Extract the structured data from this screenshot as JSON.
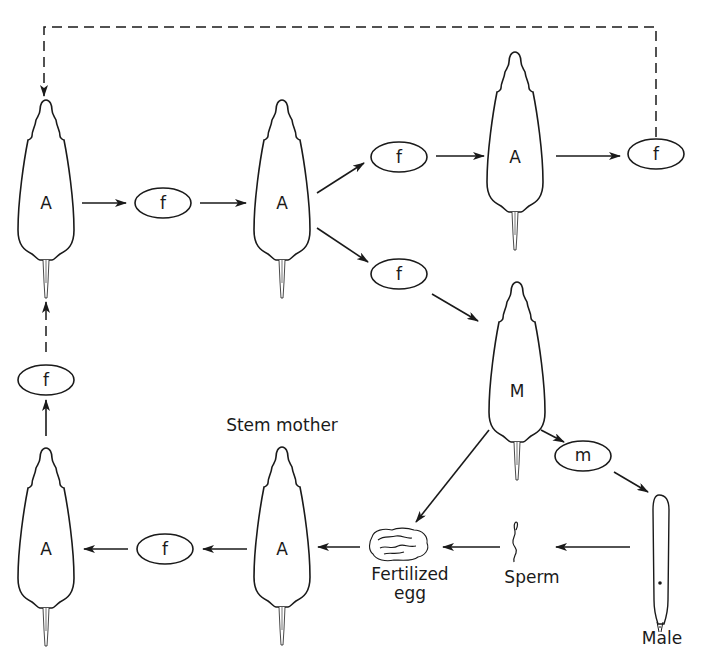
{
  "diagram": {
    "stroke_color": "#1a1a1a",
    "background": "#ffffff",
    "nodes": {
      "aphid_top_left": {
        "label": "A",
        "type": "asexual-female"
      },
      "oval_f_1": {
        "label": "f"
      },
      "aphid_top_middle": {
        "label": "A",
        "type": "asexual-female"
      },
      "oval_f_upper": {
        "label": "f"
      },
      "aphid_top_right": {
        "label": "A",
        "type": "asexual-female"
      },
      "oval_f_right": {
        "label": "f"
      },
      "oval_f_lower": {
        "label": "f"
      },
      "aphid_sexual": {
        "label": "M",
        "type": "sexual-female"
      },
      "oval_m": {
        "label": "m"
      },
      "male": {
        "label": "Male"
      },
      "sperm": {
        "label": "Sperm"
      },
      "fertilized_egg": {
        "label_line1": "Fertilized",
        "label_line2": "egg"
      },
      "stem_mother": {
        "label": "A",
        "caption": "Stem mother"
      },
      "oval_f_bottom": {
        "label": "f"
      },
      "aphid_bottom_left": {
        "label": "A",
        "type": "asexual-female"
      },
      "oval_f_left": {
        "label": "f"
      }
    },
    "edges": [
      {
        "from": "aphid_top_left",
        "to": "oval_f_1",
        "style": "solid"
      },
      {
        "from": "oval_f_1",
        "to": "aphid_top_middle",
        "style": "solid"
      },
      {
        "from": "aphid_top_middle",
        "to": "oval_f_upper",
        "style": "solid"
      },
      {
        "from": "oval_f_upper",
        "to": "aphid_top_right",
        "style": "solid"
      },
      {
        "from": "aphid_top_right",
        "to": "oval_f_right",
        "style": "solid"
      },
      {
        "from": "oval_f_right",
        "to": "aphid_top_left",
        "style": "dashed"
      },
      {
        "from": "aphid_top_middle",
        "to": "oval_f_lower",
        "style": "solid"
      },
      {
        "from": "oval_f_lower",
        "to": "aphid_sexual",
        "style": "solid"
      },
      {
        "from": "aphid_sexual",
        "to": "oval_m",
        "style": "solid"
      },
      {
        "from": "oval_m",
        "to": "male",
        "style": "solid"
      },
      {
        "from": "aphid_sexual",
        "to": "fertilized_egg",
        "style": "solid"
      },
      {
        "from": "male",
        "to": "sperm",
        "style": "solid"
      },
      {
        "from": "sperm",
        "to": "fertilized_egg",
        "style": "solid"
      },
      {
        "from": "fertilized_egg",
        "to": "stem_mother",
        "style": "solid"
      },
      {
        "from": "stem_mother",
        "to": "oval_f_bottom",
        "style": "solid"
      },
      {
        "from": "oval_f_bottom",
        "to": "aphid_bottom_left",
        "style": "solid"
      },
      {
        "from": "aphid_bottom_left",
        "to": "oval_f_left",
        "style": "solid"
      },
      {
        "from": "oval_f_left",
        "to": "aphid_top_left",
        "style": "dashed"
      }
    ]
  }
}
